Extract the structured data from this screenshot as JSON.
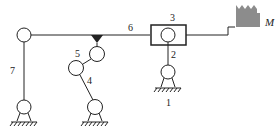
{
  "diagram": {
    "type": "mechanism-kinematic-diagram",
    "labels": {
      "link1": "1",
      "link2": "2",
      "link3": "3",
      "link4": "4",
      "link5": "5",
      "link6": "6",
      "link7": "7",
      "motor": "M"
    },
    "colors": {
      "line": "#222222",
      "motor": "#8c8c8c",
      "background": "#ffffff"
    }
  }
}
